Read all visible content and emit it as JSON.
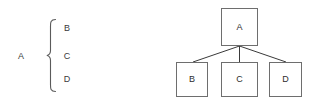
{
  "diagram": {
    "type": "set-to-tree-equivalence",
    "background_color": "#ffffff",
    "stroke_color": "#555555",
    "text_color": "#333333",
    "left_panel": {
      "name": "set-notation",
      "parent_label": "A",
      "brace_glyph": "{",
      "members": [
        {
          "label": "B"
        },
        {
          "label": "C"
        },
        {
          "label": "D"
        }
      ]
    },
    "right_panel": {
      "name": "tree-diagram",
      "root": {
        "label": "A"
      },
      "children": [
        {
          "label": "B"
        },
        {
          "label": "C"
        },
        {
          "label": "D"
        }
      ],
      "edge_count": 3
    }
  }
}
